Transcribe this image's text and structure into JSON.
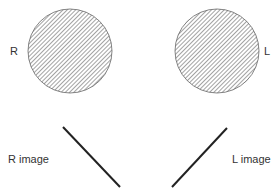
{
  "diagram": {
    "eyes": [
      {
        "id": "right",
        "label": "R",
        "cx": 70,
        "cy": 51,
        "r": 42
      },
      {
        "id": "left",
        "label": "L",
        "cx": 217,
        "cy": 51,
        "r": 42
      }
    ],
    "images": [
      {
        "id": "right",
        "label": "R image",
        "x1": 63,
        "y1": 127,
        "x2": 120,
        "y2": 187
      },
      {
        "id": "left",
        "label": "L image",
        "x1": 172,
        "y1": 187,
        "x2": 227,
        "y2": 128
      }
    ],
    "colors": {
      "hatch": "#555555",
      "line": "#222222",
      "text": "#333333"
    }
  }
}
